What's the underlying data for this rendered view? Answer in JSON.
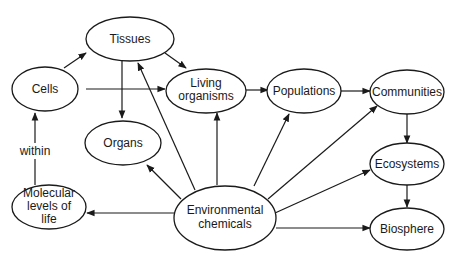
{
  "diagram": {
    "nodes": {
      "tissues": {
        "label": "Tissues"
      },
      "cells": {
        "label": "Cells"
      },
      "living_organisms": {
        "line1": "Living",
        "line2": "organisms"
      },
      "organs": {
        "label": "Organs"
      },
      "populations": {
        "label": "Populations"
      },
      "communities": {
        "label": "Communities"
      },
      "ecosystems": {
        "label": "Ecosystems"
      },
      "biosphere": {
        "label": "Biosphere"
      },
      "molecular": {
        "line1": "Molecular",
        "line2": "levels of",
        "line3": "life"
      },
      "environmental": {
        "line1": "Environmental",
        "line2": "chemicals"
      }
    },
    "edge_labels": {
      "within": "within"
    },
    "edges": [
      {
        "from": "Molecular levels of life",
        "to": "Cells",
        "label": "within"
      },
      {
        "from": "Cells",
        "to": "Tissues"
      },
      {
        "from": "Cells",
        "to": "Living organisms"
      },
      {
        "from": "Tissues",
        "to": "Living organisms"
      },
      {
        "from": "Tissues",
        "to": "Organs"
      },
      {
        "from": "Living organisms",
        "to": "Populations"
      },
      {
        "from": "Populations",
        "to": "Communities"
      },
      {
        "from": "Communities",
        "to": "Ecosystems"
      },
      {
        "from": "Ecosystems",
        "to": "Biosphere"
      },
      {
        "from": "Environmental chemicals",
        "to": "Molecular levels of life"
      },
      {
        "from": "Environmental chemicals",
        "to": "Organs"
      },
      {
        "from": "Environmental chemicals",
        "to": "Tissues"
      },
      {
        "from": "Environmental chemicals",
        "to": "Living organisms"
      },
      {
        "from": "Environmental chemicals",
        "to": "Populations"
      },
      {
        "from": "Environmental chemicals",
        "to": "Communities"
      },
      {
        "from": "Environmental chemicals",
        "to": "Ecosystems"
      },
      {
        "from": "Environmental chemicals",
        "to": "Biosphere"
      }
    ]
  }
}
